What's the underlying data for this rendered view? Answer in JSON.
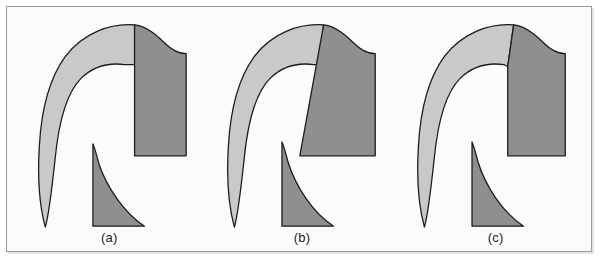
{
  "figure": {
    "type": "diagram",
    "background_color": "#fbfbfb",
    "page_color": "#ffffff",
    "frame_border_color": "#9a9a9a",
    "colors": {
      "light_gray_fill": "#c9c9c9",
      "dark_gray_fill": "#8f8f8f",
      "outline": "#1c1c1c",
      "label_text": "#1b1b1b"
    },
    "panels": [
      {
        "id": "a",
        "label": "(a)",
        "regions": [
          {
            "name": "upper-hook-light-region",
            "fill": "#c9c9c9"
          },
          {
            "name": "upper-block-dark-region",
            "fill": "#8f8f8f"
          },
          {
            "name": "lower-spur-dark-region",
            "fill": "#8f8f8f"
          }
        ],
        "divider": {
          "name": "light-dark-divider",
          "orientation": "vertical",
          "x_fraction": 0.655
        }
      },
      {
        "id": "b",
        "label": "(b)",
        "regions": [
          {
            "name": "upper-hook-light-region",
            "fill": "#c9c9c9"
          },
          {
            "name": "upper-block-dark-region",
            "fill": "#8f8f8f"
          },
          {
            "name": "lower-spur-dark-region",
            "fill": "#8f8f8f"
          }
        ],
        "divider": {
          "name": "light-dark-divider",
          "orientation": "slanted-left",
          "x_fraction": 0.6
        }
      },
      {
        "id": "c",
        "label": "(c)",
        "regions": [
          {
            "name": "upper-hook-light-region",
            "fill": "#c9c9c9"
          },
          {
            "name": "upper-block-dark-region",
            "fill": "#8f8f8f"
          },
          {
            "name": "lower-spur-dark-region",
            "fill": "#8f8f8f"
          }
        ],
        "divider": {
          "name": "light-dark-divider",
          "orientation": "slanted-right",
          "x_fraction": 0.575
        }
      }
    ]
  }
}
